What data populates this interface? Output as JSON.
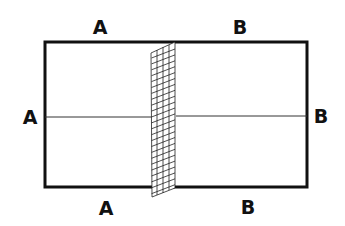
{
  "diagram": {
    "labels": {
      "top_left": "A",
      "top_right": "B",
      "left": "A",
      "right": "B",
      "bottom_left": "A",
      "bottom_right": "B"
    },
    "colors": {
      "stroke": "#111111",
      "background": "#ffffff"
    },
    "elements": [
      "outer-rectangle",
      "horizontal-midline",
      "grid-strip"
    ]
  }
}
